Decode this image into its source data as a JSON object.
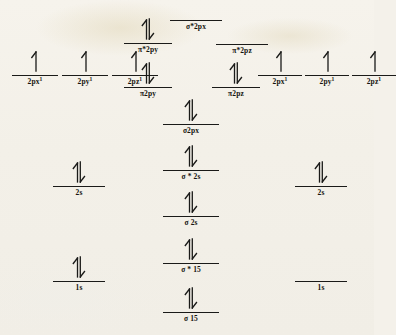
{
  "diagram": {
    "background_color": "#f4f1ea",
    "ink_color": "#1a1a18",
    "columns": [
      "left-atomic-orbitals",
      "molecular-orbitals",
      "right-atomic-orbitals"
    ]
  },
  "chart_data": {
    "type": "diagram",
    "xlabel": "",
    "ylabel": "Energy",
    "grid": false,
    "legend": "none",
    "levels": [
      {
        "id": "left-2px",
        "label": "2px",
        "superscript": "1",
        "column": "left",
        "electrons": "single-up",
        "electron_count": 1,
        "x": 12,
        "y": 77,
        "width": 46
      },
      {
        "id": "left-2py",
        "label": "2py",
        "superscript": "1",
        "column": "left",
        "electrons": "single-up",
        "electron_count": 1,
        "x": 62,
        "y": 77,
        "width": 46
      },
      {
        "id": "left-2pz",
        "label": "2pz",
        "superscript": "1",
        "column": "left",
        "electrons": "single-up",
        "electron_count": 1,
        "x": 112,
        "y": 77,
        "width": 46
      },
      {
        "id": "left-2s",
        "label": "2s",
        "superscript": "",
        "column": "left",
        "electrons": "pair",
        "electron_count": 2,
        "x": 53,
        "y": 188,
        "width": 52
      },
      {
        "id": "left-1s",
        "label": "1s",
        "superscript": "",
        "column": "left",
        "electrons": "pair",
        "electron_count": 2,
        "x": 53,
        "y": 283,
        "width": 52
      },
      {
        "id": "sigma-star-2px",
        "label": "σ*2px",
        "superscript": "",
        "column": "center",
        "electrons": "none",
        "electron_count": 0,
        "x": 170,
        "y": 22,
        "width": 52
      },
      {
        "id": "pi-star-2py",
        "label": "π*2py",
        "superscript": "",
        "column": "center",
        "electrons": "pair",
        "electron_count": 2,
        "x": 124,
        "y": 45,
        "width": 48
      },
      {
        "id": "pi-star-2pz",
        "label": "π*2pz",
        "superscript": "",
        "column": "center",
        "electrons": "none",
        "electron_count": 0,
        "x": 216,
        "y": 46,
        "width": 52
      },
      {
        "id": "pi-2py",
        "label": "π2py",
        "superscript": "",
        "column": "center",
        "electrons": "pair",
        "electron_count": 2,
        "x": 124,
        "y": 89,
        "width": 48
      },
      {
        "id": "pi-2pz",
        "label": "π2pz",
        "superscript": "",
        "column": "center",
        "electrons": "pair",
        "electron_count": 2,
        "x": 212,
        "y": 89,
        "width": 48
      },
      {
        "id": "sigma-2px",
        "label": "σ2px",
        "superscript": "",
        "column": "center",
        "electrons": "pair",
        "electron_count": 2,
        "x": 163,
        "y": 126,
        "width": 56
      },
      {
        "id": "sigma-star-2s",
        "label": "σ * 2s",
        "superscript": "",
        "column": "center",
        "electrons": "pair",
        "electron_count": 2,
        "x": 163,
        "y": 172,
        "width": 56
      },
      {
        "id": "sigma-2s",
        "label": "σ 2s",
        "superscript": "",
        "column": "center",
        "electrons": "pair",
        "electron_count": 2,
        "x": 163,
        "y": 218,
        "width": 56
      },
      {
        "id": "sigma-star-1s",
        "label": "σ * 15",
        "superscript": "",
        "column": "center",
        "electrons": "pair",
        "electron_count": 2,
        "x": 163,
        "y": 265,
        "width": 56
      },
      {
        "id": "sigma-1s",
        "label": "σ 15",
        "superscript": "",
        "column": "center",
        "electrons": "pair",
        "electron_count": 2,
        "x": 163,
        "y": 314,
        "width": 56
      },
      {
        "id": "right-2px",
        "label": "2px",
        "superscript": "1",
        "column": "right",
        "electrons": "single-up",
        "electron_count": 1,
        "x": 258,
        "y": 77,
        "width": 44
      },
      {
        "id": "right-2py",
        "label": "2py",
        "superscript": "1",
        "column": "right",
        "electrons": "single-up",
        "electron_count": 1,
        "x": 305,
        "y": 77,
        "width": 44
      },
      {
        "id": "right-2pz",
        "label": "2pz",
        "superscript": "1",
        "column": "right",
        "electrons": "single-up",
        "electron_count": 1,
        "x": 352,
        "y": 77,
        "width": 44
      },
      {
        "id": "right-2s",
        "label": "2s",
        "superscript": "",
        "column": "right",
        "electrons": "pair",
        "electron_count": 2,
        "x": 295,
        "y": 188,
        "width": 52
      },
      {
        "id": "right-1s",
        "label": "1s",
        "superscript": "",
        "column": "right",
        "electrons": "none",
        "electron_count": 0,
        "x": 295,
        "y": 283,
        "width": 52
      }
    ]
  }
}
